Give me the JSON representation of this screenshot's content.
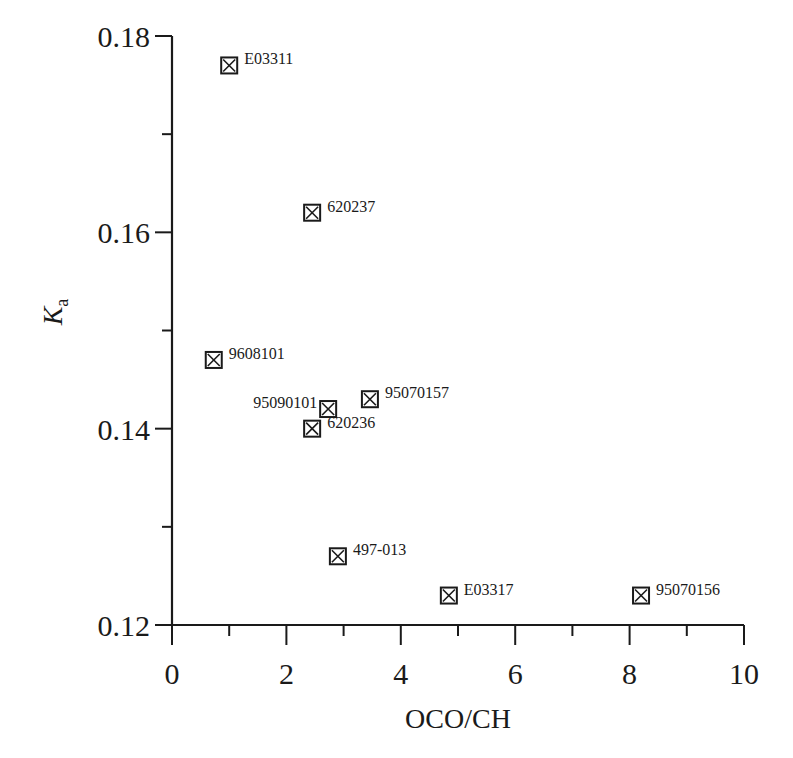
{
  "chart_data": {
    "type": "scatter",
    "title": "",
    "xlabel": "OCO/CH",
    "ylabel": "K",
    "ylabel_subscript": "a",
    "xlim": [
      0,
      10
    ],
    "ylim": [
      0.12,
      0.18
    ],
    "x_ticks": [
      0,
      2,
      4,
      6,
      8,
      10
    ],
    "x_minor_ticks": [
      1,
      3,
      5,
      7,
      9
    ],
    "y_ticks": [
      0.12,
      0.14,
      0.16,
      0.18
    ],
    "y_tick_labels": [
      "0.12",
      "0.14",
      "0.16",
      "0.18"
    ],
    "y_minor_ticks": [
      0.13,
      0.15,
      0.17
    ],
    "grid": false,
    "legend": null,
    "marker": "boxed-x",
    "points": [
      {
        "label": "E03311",
        "x": 1.0,
        "y": 0.177,
        "label_side": "right"
      },
      {
        "label": "620237",
        "x": 2.45,
        "y": 0.162,
        "label_side": "right"
      },
      {
        "label": "9608101",
        "x": 0.73,
        "y": 0.147,
        "label_side": "right"
      },
      {
        "label": "95070157",
        "x": 3.46,
        "y": 0.143,
        "label_side": "right"
      },
      {
        "label": "95090101",
        "x": 2.73,
        "y": 0.142,
        "label_side": "left"
      },
      {
        "label": "620236",
        "x": 2.45,
        "y": 0.14,
        "label_side": "right"
      },
      {
        "label": "497-013",
        "x": 2.9,
        "y": 0.127,
        "label_side": "right"
      },
      {
        "label": "E03317",
        "x": 4.84,
        "y": 0.123,
        "label_side": "right"
      },
      {
        "label": "95070156",
        "x": 8.2,
        "y": 0.123,
        "label_side": "right"
      }
    ]
  }
}
